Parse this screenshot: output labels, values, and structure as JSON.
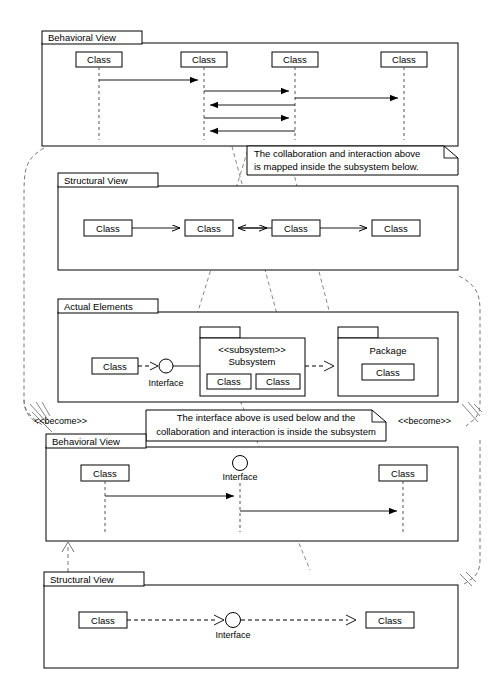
{
  "diagram": {
    "background_color": "#ffffff",
    "line_color": "#000000",
    "dashed_link_color": "#888888"
  },
  "frames": [
    {
      "id": "behavioral-view-top",
      "label": "Behavioral View",
      "type": "sequence",
      "lifelines": [
        {
          "label": "Class"
        },
        {
          "label": "Class"
        },
        {
          "label": "Class"
        },
        {
          "label": "Class"
        }
      ],
      "messages": [
        {
          "from": 0,
          "to": 1,
          "direction": "right"
        },
        {
          "from": 1,
          "to": 2,
          "direction": "right"
        },
        {
          "from": 2,
          "to": 3,
          "direction": "right"
        },
        {
          "from": 2,
          "to": 1,
          "direction": "left"
        },
        {
          "from": 1,
          "to": 2,
          "direction": "right"
        },
        {
          "from": 2,
          "to": 1,
          "direction": "left"
        }
      ]
    },
    {
      "id": "structural-view-top",
      "label": "Structural View",
      "type": "class",
      "nodes": [
        {
          "label": "Class"
        },
        {
          "label": "Class"
        },
        {
          "label": "Class"
        },
        {
          "label": "Class"
        }
      ],
      "associations": [
        {
          "from": 0,
          "to": 1,
          "arrow": "right"
        },
        {
          "from": 2,
          "to": 1,
          "arrow": "left"
        },
        {
          "from": 1,
          "to": 2,
          "arrow": "right"
        },
        {
          "from": 2,
          "to": 3,
          "arrow": "right"
        }
      ]
    },
    {
      "id": "actual-elements",
      "label": "Actual Elements",
      "type": "component",
      "nodes": [
        {
          "label": "Class",
          "kind": "class"
        },
        {
          "label": "Interface",
          "kind": "interface"
        },
        {
          "label": "Subsystem",
          "stereotype": "<<subsystem>>",
          "kind": "subsystem",
          "children": [
            {
              "label": "Class"
            },
            {
              "label": "Class"
            }
          ]
        },
        {
          "label": "Package",
          "kind": "package",
          "children": [
            {
              "label": "Class"
            }
          ]
        }
      ]
    },
    {
      "id": "behavioral-view-bottom",
      "label": "Behavioral View",
      "type": "sequence",
      "lifelines": [
        {
          "label": "Class"
        },
        {
          "label": "Interface",
          "shape": "circle"
        },
        {
          "label": "Class"
        }
      ],
      "messages": [
        {
          "from": 0,
          "to": 1,
          "direction": "right"
        },
        {
          "from": 1,
          "to": 2,
          "direction": "right"
        }
      ]
    },
    {
      "id": "structural-view-bottom",
      "label": "Structural View",
      "type": "class",
      "nodes": [
        {
          "label": "Class",
          "kind": "class"
        },
        {
          "label": "Interface",
          "kind": "interface"
        },
        {
          "label": "Class",
          "kind": "class"
        }
      ]
    }
  ],
  "notes": [
    {
      "id": "note-top",
      "lines": [
        "The collaboration and interaction above",
        "is mapped inside the subsystem below."
      ]
    },
    {
      "id": "note-bottom",
      "lines": [
        "The interface above is used below and the",
        "collaboration and interaction is inside the subsystem"
      ]
    }
  ],
  "become_labels": [
    {
      "id": "become-left",
      "text": "<<become>>"
    },
    {
      "id": "become-right",
      "text": "<<become>>"
    }
  ]
}
